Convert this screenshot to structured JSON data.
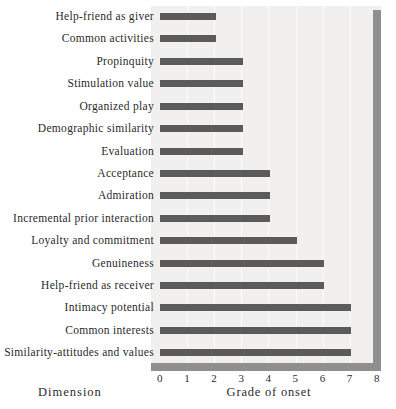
{
  "chart_data": {
    "type": "bar",
    "orientation": "horizontal",
    "title": "",
    "xlabel": "Grade of onset",
    "ylabel": "Dimension",
    "xlim": [
      0,
      8
    ],
    "xticks": [
      0,
      1,
      2,
      3,
      4,
      5,
      6,
      7,
      8
    ],
    "grid": "vertical-light",
    "legend": "none",
    "categories": [
      "Help-friend as giver",
      "Common activities",
      "Propinquity",
      "Stimulation value",
      "Organized play",
      "Demographic similarity",
      "Evaluation",
      "Acceptance",
      "Admiration",
      "Incremental prior interaction",
      "Loyalty and commitment",
      "Genuineness",
      "Help-friend as receiver",
      "Intimacy potential",
      "Common interests",
      "Similarity-attitudes and values"
    ],
    "values": [
      2,
      2,
      3,
      3,
      3,
      3,
      3,
      4,
      4,
      4,
      5,
      6,
      6,
      7,
      7,
      7
    ],
    "colors": {
      "bar": "#5b5b5b",
      "wall": "#8f8f8f",
      "plot_bg": "#f1f0ee",
      "grid_line": "#fbfbf9",
      "text": "#2a2a2a"
    }
  }
}
